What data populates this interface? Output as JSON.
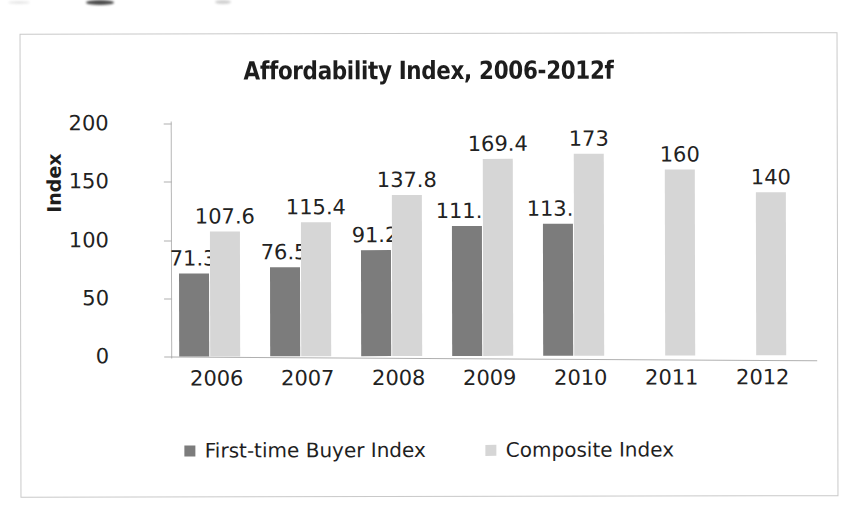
{
  "chart_data": {
    "type": "bar",
    "title": "Affordability Index, 2006-2012f",
    "xlabel": "",
    "ylabel": "Index",
    "categories": [
      "2006",
      "2007",
      "2008",
      "2009",
      "2010",
      "2011",
      "2012"
    ],
    "series": [
      {
        "name": "First-time Buyer Index",
        "color": "#7c7c7c",
        "values": [
          71.3,
          76.5,
          91.2,
          111.9,
          113.6,
          null,
          null
        ],
        "labels": [
          "71.3",
          "76.5",
          "91.2",
          "111.9",
          "113.6",
          "",
          ""
        ]
      },
      {
        "name": "Composite Index",
        "color": "#d6d6d6",
        "values": [
          107.6,
          115.4,
          137.8,
          169.4,
          173,
          160,
          140
        ],
        "labels": [
          "107.6",
          "115.4",
          "137.8",
          "169.4",
          "173",
          "160",
          "140"
        ]
      }
    ],
    "ylim": [
      0,
      200
    ],
    "yticks": [
      0,
      50,
      100,
      150,
      200
    ],
    "ytick_labels": [
      "0",
      "50",
      "100",
      "150",
      "200"
    ],
    "grid": false,
    "legend_position": "bottom",
    "data_labels_shown": true
  },
  "colors": {
    "first_time_buyer": "#7c7c7c",
    "composite": "#d6d6d6",
    "frame_border": "#c9c9c9",
    "axis_line": "#b0b0b0",
    "text": "#222222"
  }
}
